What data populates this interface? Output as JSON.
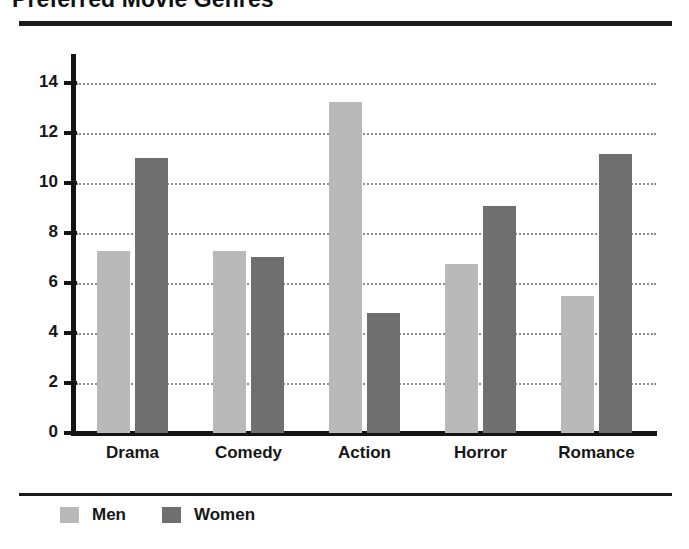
{
  "chart_data": {
    "type": "bar",
    "title": "Preferred Movie Genres",
    "xlabel": "",
    "ylabel": "",
    "categories": [
      "Drama",
      "Comedy",
      "Action",
      "Horror",
      "Romance"
    ],
    "series": [
      {
        "name": "Men",
        "color": "#b9b9b9",
        "values": [
          7.3,
          7.3,
          13.25,
          6.75,
          5.5
        ]
      },
      {
        "name": "Women",
        "color": "#6f6f6f",
        "values": [
          11.0,
          7.05,
          4.8,
          9.1,
          11.15
        ]
      }
    ],
    "ylim": [
      0,
      14
    ],
    "ytick_values": [
      0,
      2,
      4,
      6,
      8,
      10,
      12,
      14
    ],
    "ytick_labels": [
      "0",
      "2",
      "4",
      "6",
      "8",
      "10",
      "12",
      "14"
    ],
    "grid": "horizontal-dotted",
    "legend_position": "bottom-left",
    "legend_entries": [
      "Men",
      "Women"
    ]
  },
  "axis": {
    "y_labels": [
      "14",
      "12",
      "10",
      "8",
      "6",
      "4",
      "2",
      "0"
    ]
  },
  "legend": {
    "items": [
      {
        "label": "Men"
      },
      {
        "label": "Women"
      }
    ]
  }
}
